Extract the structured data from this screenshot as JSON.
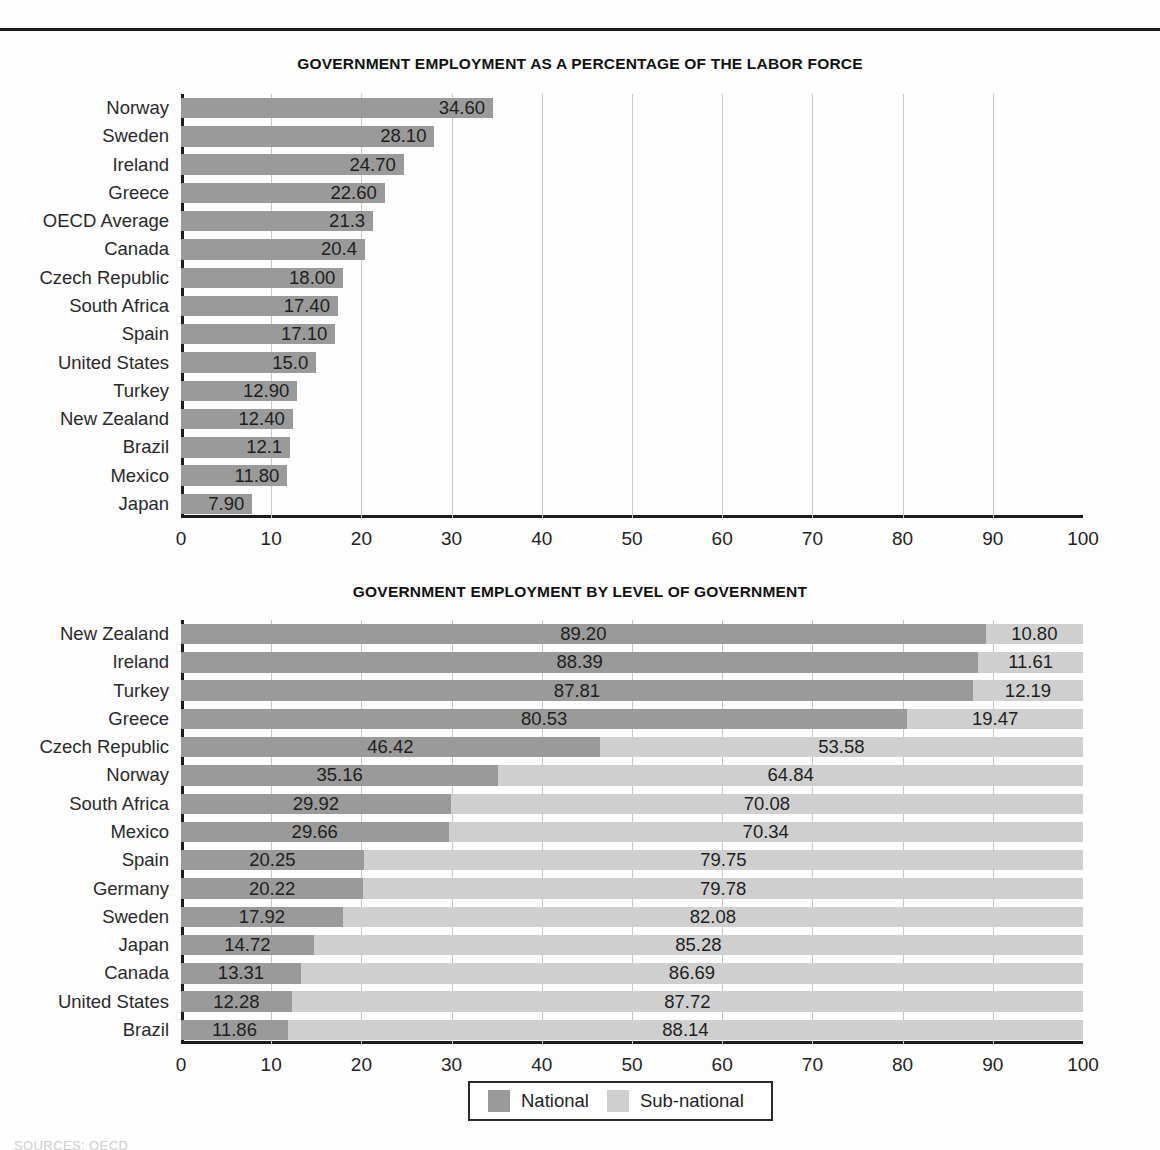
{
  "page": {
    "source_note": "SOURCES: OECD"
  },
  "chart_data": [
    {
      "type": "bar",
      "title": "GOVERNMENT EMPLOYMENT AS A PERCENTAGE OF THE LABOR FORCE",
      "xlabel": "",
      "ylabel": "",
      "xlim": [
        0,
        100
      ],
      "xticks": [
        "0",
        "10",
        "20",
        "30",
        "40",
        "50",
        "60",
        "70",
        "80",
        "90",
        "100"
      ],
      "grid": true,
      "orientation": "horizontal",
      "categories": [
        "Norway",
        "Sweden",
        "Ireland",
        "Greece",
        "OECD Average",
        "Canada",
        "Czech Republic",
        "South Africa",
        "Spain",
        "United States",
        "Turkey",
        "New Zealand",
        "Brazil",
        "Mexico",
        "Japan"
      ],
      "values": [
        34.6,
        28.1,
        24.7,
        22.6,
        21.3,
        20.4,
        18.0,
        17.4,
        17.1,
        15.0,
        12.9,
        12.4,
        12.1,
        11.8,
        7.9
      ],
      "labels": [
        "34.60",
        "28.10",
        "24.70",
        "22.60",
        "21.3",
        "20.4",
        "18.00",
        "17.40",
        "17.10",
        "15.0",
        "12.90",
        "12.40",
        "12.1",
        "11.80",
        "7.90"
      ],
      "bar_color": "#9a9a9a"
    },
    {
      "type": "bar",
      "stacked": true,
      "title": "GOVERNMENT EMPLOYMENT BY LEVEL OF GOVERNMENT",
      "xlabel": "",
      "ylabel": "",
      "xlim": [
        0,
        100
      ],
      "xticks": [
        "0",
        "10",
        "20",
        "30",
        "40",
        "50",
        "60",
        "70",
        "80",
        "90",
        "100"
      ],
      "grid": true,
      "orientation": "horizontal",
      "legend_position": "bottom",
      "categories": [
        "New Zealand",
        "Ireland",
        "Turkey",
        "Greece",
        "Czech Republic",
        "Norway",
        "South Africa",
        "Mexico",
        "Spain",
        "Germany",
        "Sweden",
        "Japan",
        "Canada",
        "United States",
        "Brazil"
      ],
      "series": [
        {
          "name": "National",
          "color": "#9a9a9a",
          "values": [
            89.2,
            88.39,
            87.81,
            80.53,
            46.42,
            35.16,
            29.92,
            29.66,
            20.25,
            20.22,
            17.92,
            14.72,
            13.31,
            12.28,
            11.86
          ],
          "labels": [
            "89.20",
            "88.39",
            "87.81",
            "80.53",
            "46.42",
            "35.16",
            "29.92",
            "29.66",
            "20.25",
            "20.22",
            "17.92",
            "14.72",
            "13.31",
            "12.28",
            "11.86"
          ]
        },
        {
          "name": "Sub-national",
          "color": "#cfcfcf",
          "values": [
            10.8,
            11.61,
            12.19,
            19.47,
            53.58,
            64.84,
            70.08,
            70.34,
            79.75,
            79.78,
            82.08,
            85.28,
            86.69,
            87.72,
            88.14
          ],
          "labels": [
            "10.80",
            "11.61",
            "12.19",
            "19.47",
            "53.58",
            "64.84",
            "70.08",
            "70.34",
            "79.75",
            "79.78",
            "82.08",
            "85.28",
            "86.69",
            "87.72",
            "88.14"
          ]
        }
      ]
    }
  ]
}
